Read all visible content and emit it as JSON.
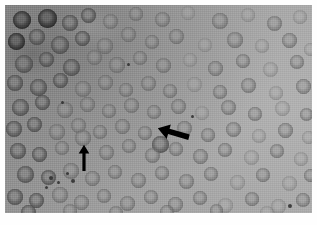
{
  "figure": {
    "kind": "light-microscopy-photomicrograph",
    "modality": "brightfield grayscale",
    "plate": {
      "x": 5,
      "y": 5,
      "width": 307,
      "height": 208,
      "page_background": "#ffffff",
      "field_background": "#9a9a9a",
      "illumination": "darker upper-left, brighter right and lower-right"
    },
    "palette": {
      "background_dark": "#8d8d8d",
      "background_mid": "#9a9a9a",
      "background_light": "#a9a9a9",
      "cell_rim_dark": "#5a5a5a",
      "cell_rim_mid": "#6f6f6f",
      "cell_center_pale": "#8f8f8f",
      "cell_very_dark": "#2e2e2e",
      "annotation": "#000000",
      "page": "#ffffff"
    }
  },
  "annotations": [
    {
      "name": "arrow-pointing-down-left",
      "shape": "solid-filled-arrow",
      "color": "#000000",
      "x": 150,
      "y": 119,
      "width": 34,
      "height": 20,
      "rotation_deg": 196,
      "points_at": "target cell at lower-left of arrow tip"
    },
    {
      "name": "arrow-pointing-up",
      "shape": "solid-filled-arrow",
      "color": "#000000",
      "x": 72,
      "y": 139,
      "width": 13,
      "height": 26,
      "rotation_deg": 270,
      "points_at": "target cell directly above arrow tip"
    }
  ],
  "cells": {
    "type": "erythrocytes",
    "appearance": "round biconcave discs with darker rim and pale central zone",
    "approx_count": 118,
    "diameter_px_range": [
      11,
      20
    ],
    "items": [
      {
        "x": 8,
        "y": 6,
        "d": 18,
        "tone": "very-dark"
      },
      {
        "x": 33,
        "y": 4,
        "d": 19,
        "tone": "very-dark"
      },
      {
        "x": 57,
        "y": 10,
        "d": 16,
        "tone": "dark"
      },
      {
        "x": 76,
        "y": 3,
        "d": 15,
        "tone": "dark"
      },
      {
        "x": 98,
        "y": 9,
        "d": 15,
        "tone": "mid"
      },
      {
        "x": 124,
        "y": 2,
        "d": 14,
        "tone": "mid"
      },
      {
        "x": 150,
        "y": 7,
        "d": 15,
        "tone": "mid"
      },
      {
        "x": 176,
        "y": 1,
        "d": 14,
        "tone": "light"
      },
      {
        "x": 207,
        "y": 8,
        "d": 16,
        "tone": "mid"
      },
      {
        "x": 236,
        "y": 3,
        "d": 14,
        "tone": "light"
      },
      {
        "x": 262,
        "y": 11,
        "d": 15,
        "tone": "mid"
      },
      {
        "x": 288,
        "y": 5,
        "d": 14,
        "tone": "light"
      },
      {
        "x": 3,
        "y": 28,
        "d": 17,
        "tone": "very-dark"
      },
      {
        "x": 24,
        "y": 24,
        "d": 16,
        "tone": "dark"
      },
      {
        "x": 46,
        "y": 31,
        "d": 18,
        "tone": "dark"
      },
      {
        "x": 70,
        "y": 26,
        "d": 15,
        "tone": "dark"
      },
      {
        "x": 92,
        "y": 33,
        "d": 16,
        "tone": "mid"
      },
      {
        "x": 116,
        "y": 22,
        "d": 15,
        "tone": "mid"
      },
      {
        "x": 140,
        "y": 30,
        "d": 14,
        "tone": "mid"
      },
      {
        "x": 164,
        "y": 24,
        "d": 15,
        "tone": "mid"
      },
      {
        "x": 193,
        "y": 33,
        "d": 14,
        "tone": "light"
      },
      {
        "x": 222,
        "y": 27,
        "d": 16,
        "tone": "mid"
      },
      {
        "x": 250,
        "y": 34,
        "d": 14,
        "tone": "light"
      },
      {
        "x": 277,
        "y": 28,
        "d": 15,
        "tone": "mid"
      },
      {
        "x": 299,
        "y": 38,
        "d": 13,
        "tone": "light"
      },
      {
        "x": 10,
        "y": 50,
        "d": 18,
        "tone": "dark"
      },
      {
        "x": 34,
        "y": 47,
        "d": 15,
        "tone": "dark"
      },
      {
        "x": 58,
        "y": 54,
        "d": 17,
        "tone": "dark"
      },
      {
        "x": 82,
        "y": 45,
        "d": 15,
        "tone": "mid"
      },
      {
        "x": 104,
        "y": 52,
        "d": 16,
        "tone": "mid"
      },
      {
        "x": 128,
        "y": 46,
        "d": 14,
        "tone": "mid"
      },
      {
        "x": 151,
        "y": 53,
        "d": 15,
        "tone": "mid"
      },
      {
        "x": 178,
        "y": 48,
        "d": 14,
        "tone": "light"
      },
      {
        "x": 203,
        "y": 56,
        "d": 15,
        "tone": "mid"
      },
      {
        "x": 231,
        "y": 49,
        "d": 14,
        "tone": "mid"
      },
      {
        "x": 258,
        "y": 57,
        "d": 15,
        "tone": "light"
      },
      {
        "x": 285,
        "y": 50,
        "d": 14,
        "tone": "mid"
      },
      {
        "x": 2,
        "y": 70,
        "d": 16,
        "tone": "dark"
      },
      {
        "x": 25,
        "y": 74,
        "d": 17,
        "tone": "dark"
      },
      {
        "x": 48,
        "y": 68,
        "d": 15,
        "tone": "dark"
      },
      {
        "x": 70,
        "y": 76,
        "d": 16,
        "tone": "mid"
      },
      {
        "x": 93,
        "y": 70,
        "d": 15,
        "tone": "mid"
      },
      {
        "x": 114,
        "y": 78,
        "d": 14,
        "tone": "mid"
      },
      {
        "x": 136,
        "y": 71,
        "d": 15,
        "tone": "mid"
      },
      {
        "x": 158,
        "y": 79,
        "d": 14,
        "tone": "mid"
      },
      {
        "x": 182,
        "y": 72,
        "d": 15,
        "tone": "light"
      },
      {
        "x": 208,
        "y": 80,
        "d": 14,
        "tone": "mid"
      },
      {
        "x": 236,
        "y": 73,
        "d": 15,
        "tone": "mid"
      },
      {
        "x": 264,
        "y": 81,
        "d": 14,
        "tone": "light"
      },
      {
        "x": 291,
        "y": 74,
        "d": 15,
        "tone": "mid"
      },
      {
        "x": 7,
        "y": 94,
        "d": 17,
        "tone": "dark"
      },
      {
        "x": 30,
        "y": 90,
        "d": 15,
        "tone": "dark"
      },
      {
        "x": 52,
        "y": 97,
        "d": 16,
        "tone": "mid"
      },
      {
        "x": 75,
        "y": 92,
        "d": 15,
        "tone": "mid"
      },
      {
        "x": 97,
        "y": 99,
        "d": 14,
        "tone": "mid"
      },
      {
        "x": 119,
        "y": 93,
        "d": 15,
        "tone": "mid"
      },
      {
        "x": 142,
        "y": 100,
        "d": 14,
        "tone": "mid"
      },
      {
        "x": 166,
        "y": 94,
        "d": 15,
        "tone": "mid"
      },
      {
        "x": 190,
        "y": 101,
        "d": 14,
        "tone": "light"
      },
      {
        "x": 216,
        "y": 95,
        "d": 15,
        "tone": "mid"
      },
      {
        "x": 243,
        "y": 102,
        "d": 14,
        "tone": "mid"
      },
      {
        "x": 270,
        "y": 96,
        "d": 15,
        "tone": "light"
      },
      {
        "x": 295,
        "y": 103,
        "d": 13,
        "tone": "mid"
      },
      {
        "x": 1,
        "y": 116,
        "d": 16,
        "tone": "dark"
      },
      {
        "x": 22,
        "y": 112,
        "d": 15,
        "tone": "dark"
      },
      {
        "x": 44,
        "y": 119,
        "d": 16,
        "tone": "mid"
      },
      {
        "x": 66,
        "y": 113,
        "d": 15,
        "tone": "mid"
      },
      {
        "x": 88,
        "y": 120,
        "d": 14,
        "tone": "mid"
      },
      {
        "x": 110,
        "y": 114,
        "d": 15,
        "tone": "mid"
      },
      {
        "x": 133,
        "y": 121,
        "d": 14,
        "tone": "mid"
      },
      {
        "x": 147,
        "y": 131,
        "d": 17,
        "tone": "dark"
      },
      {
        "x": 172,
        "y": 116,
        "d": 15,
        "tone": "mid"
      },
      {
        "x": 196,
        "y": 123,
        "d": 14,
        "tone": "mid"
      },
      {
        "x": 221,
        "y": 117,
        "d": 15,
        "tone": "mid"
      },
      {
        "x": 247,
        "y": 124,
        "d": 14,
        "tone": "light"
      },
      {
        "x": 273,
        "y": 118,
        "d": 15,
        "tone": "mid"
      },
      {
        "x": 297,
        "y": 126,
        "d": 13,
        "tone": "light"
      },
      {
        "x": 5,
        "y": 138,
        "d": 16,
        "tone": "dark"
      },
      {
        "x": 27,
        "y": 142,
        "d": 15,
        "tone": "dark"
      },
      {
        "x": 50,
        "y": 136,
        "d": 14,
        "tone": "mid"
      },
      {
        "x": 70,
        "y": 125,
        "d": 16,
        "tone": "mid"
      },
      {
        "x": 94,
        "y": 140,
        "d": 15,
        "tone": "mid"
      },
      {
        "x": 117,
        "y": 134,
        "d": 14,
        "tone": "mid"
      },
      {
        "x": 140,
        "y": 143,
        "d": 15,
        "tone": "mid"
      },
      {
        "x": 164,
        "y": 137,
        "d": 14,
        "tone": "mid"
      },
      {
        "x": 188,
        "y": 144,
        "d": 15,
        "tone": "mid"
      },
      {
        "x": 213,
        "y": 138,
        "d": 14,
        "tone": "mid"
      },
      {
        "x": 239,
        "y": 145,
        "d": 15,
        "tone": "light"
      },
      {
        "x": 265,
        "y": 139,
        "d": 14,
        "tone": "mid"
      },
      {
        "x": 289,
        "y": 147,
        "d": 14,
        "tone": "light"
      },
      {
        "x": 12,
        "y": 161,
        "d": 17,
        "tone": "dark"
      },
      {
        "x": 36,
        "y": 165,
        "d": 15,
        "tone": "dark"
      },
      {
        "x": 58,
        "y": 158,
        "d": 16,
        "tone": "mid"
      },
      {
        "x": 80,
        "y": 166,
        "d": 15,
        "tone": "mid"
      },
      {
        "x": 103,
        "y": 160,
        "d": 14,
        "tone": "mid"
      },
      {
        "x": 126,
        "y": 168,
        "d": 15,
        "tone": "mid"
      },
      {
        "x": 150,
        "y": 161,
        "d": 14,
        "tone": "mid"
      },
      {
        "x": 174,
        "y": 169,
        "d": 15,
        "tone": "mid"
      },
      {
        "x": 199,
        "y": 162,
        "d": 14,
        "tone": "mid"
      },
      {
        "x": 225,
        "y": 170,
        "d": 15,
        "tone": "light"
      },
      {
        "x": 251,
        "y": 163,
        "d": 14,
        "tone": "mid"
      },
      {
        "x": 277,
        "y": 171,
        "d": 15,
        "tone": "light"
      },
      {
        "x": 299,
        "y": 164,
        "d": 13,
        "tone": "mid"
      },
      {
        "x": 2,
        "y": 184,
        "d": 16,
        "tone": "dark"
      },
      {
        "x": 24,
        "y": 188,
        "d": 15,
        "tone": "dark"
      },
      {
        "x": 47,
        "y": 182,
        "d": 16,
        "tone": "mid"
      },
      {
        "x": 69,
        "y": 190,
        "d": 15,
        "tone": "mid"
      },
      {
        "x": 92,
        "y": 184,
        "d": 14,
        "tone": "mid"
      },
      {
        "x": 115,
        "y": 191,
        "d": 15,
        "tone": "mid"
      },
      {
        "x": 139,
        "y": 185,
        "d": 14,
        "tone": "mid"
      },
      {
        "x": 163,
        "y": 192,
        "d": 15,
        "tone": "mid"
      },
      {
        "x": 188,
        "y": 186,
        "d": 14,
        "tone": "mid"
      },
      {
        "x": 213,
        "y": 193,
        "d": 15,
        "tone": "light"
      },
      {
        "x": 240,
        "y": 187,
        "d": 14,
        "tone": "mid"
      },
      {
        "x": 266,
        "y": 194,
        "d": 15,
        "tone": "light"
      },
      {
        "x": 291,
        "y": 188,
        "d": 14,
        "tone": "mid"
      },
      {
        "x": 16,
        "y": 200,
        "d": 15,
        "tone": "dark"
      },
      {
        "x": 58,
        "y": 199,
        "d": 14,
        "tone": "mid"
      },
      {
        "x": 104,
        "y": 201,
        "d": 14,
        "tone": "mid"
      },
      {
        "x": 155,
        "y": 200,
        "d": 14,
        "tone": "mid"
      },
      {
        "x": 205,
        "y": 199,
        "d": 13,
        "tone": "mid"
      },
      {
        "x": 255,
        "y": 201,
        "d": 14,
        "tone": "light"
      }
    ]
  },
  "debris": {
    "label": "platelets and stain precipitate",
    "items": [
      {
        "x": 44,
        "y": 171,
        "d": 4
      },
      {
        "x": 52,
        "y": 176,
        "d": 3
      },
      {
        "x": 61,
        "y": 167,
        "d": 3
      },
      {
        "x": 66,
        "y": 174,
        "d": 4
      },
      {
        "x": 40,
        "y": 181,
        "d": 3
      },
      {
        "x": 56,
        "y": 96,
        "d": 3
      },
      {
        "x": 186,
        "y": 110,
        "d": 3
      },
      {
        "x": 283,
        "y": 199,
        "d": 4
      },
      {
        "x": 122,
        "y": 58,
        "d": 3
      }
    ]
  }
}
